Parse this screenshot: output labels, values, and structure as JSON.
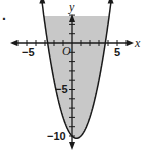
{
  "problem_marker": ".",
  "chart_data": {
    "type": "line",
    "title": "",
    "xlabel": "x",
    "ylabel": "y",
    "origin_label": "O",
    "xlim": [
      -7,
      7
    ],
    "ylim": [
      -11.5,
      4.5
    ],
    "x_tick_labels": [
      {
        "value": -5,
        "label": "−5"
      },
      {
        "value": 5,
        "label": "5"
      }
    ],
    "y_tick_labels": [
      {
        "value": -5,
        "label": "−5"
      },
      {
        "value": -10,
        "label": "−10"
      }
    ],
    "grid": false,
    "series": [
      {
        "name": "boundary parabola",
        "equation": "y = x^2 - x - 10",
        "line_style": "solid",
        "vertex": [
          0.5,
          -10.25
        ],
        "x_intercepts": [
          -2.7,
          3.7
        ],
        "x": [
          -3.3,
          -3,
          -2.5,
          -2,
          -1,
          0,
          0.5,
          1,
          2,
          3,
          4,
          4.3
        ],
        "y": [
          4.2,
          2,
          -1.25,
          -4,
          -8,
          -10,
          -10.25,
          -10,
          -8,
          -4,
          2,
          4.2
        ]
      }
    ],
    "shaded_region": "above curve (inside parabola)",
    "colors": {
      "shade": "#c8c8c8",
      "line": "#1a1a1a",
      "axis": "#1a1a1a"
    }
  }
}
